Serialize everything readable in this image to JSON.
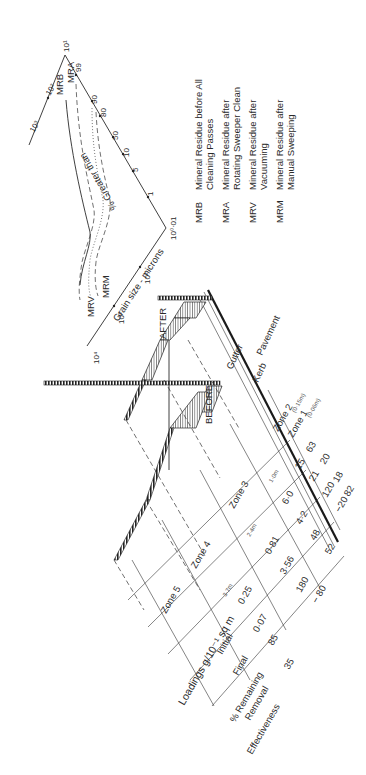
{
  "graph": {
    "x_axis_title": "Grain size - microns",
    "x_ticks": [
      "10⁴",
      "10³",
      "10²",
      "10¹",
      "10⁰·01"
    ],
    "y_axis_title": "% Greater than",
    "y_ticks": [
      "0·01",
      "1",
      "5",
      "10",
      "50",
      "80",
      "90",
      "99"
    ],
    "top_axis_ticks": [
      "10³",
      "10²",
      "10¹"
    ],
    "curve_labels": {
      "mrb": "MRB",
      "mra": "MRA",
      "mrv": "MRV",
      "mrm": "MRM"
    }
  },
  "legend": [
    {
      "code": "MRB",
      "line1": "Mineral  Residue  before  All",
      "line2": "Cleaning  Passes"
    },
    {
      "code": "MRA",
      "line1": "Mineral  Residue  after",
      "line2": "Rotating  Sweeper  Clean"
    },
    {
      "code": "MRV",
      "line1": "Mineral  Residue  after",
      "line2": "Vacuuming"
    },
    {
      "code": "MRM",
      "line1": "Mineral  Residue  after",
      "line2": "Manual  Sweeping"
    }
  ],
  "cross_section": {
    "before_label": "BEFORE",
    "after_label": "AFTER",
    "gutter_label": "Gutter",
    "kerb_label": "Kerb",
    "pavement_label": "Pavement"
  },
  "table": {
    "row_labels": {
      "loadings": "Loadings  g/10⁻¹ sq m",
      "initial": "Initial",
      "final": "Final",
      "remaining": "% Remaining",
      "removal": "Removal",
      "effectiveness": "Effectiveness"
    },
    "zones": [
      {
        "name": "Zone 5",
        "distance": "3·7m",
        "initial": "0·25",
        "final": "0·07",
        "remaining": "85",
        "removal": "35"
      },
      {
        "name": "Zone 4",
        "distance": "2·4m",
        "initial": "0·81",
        "final": "3·56",
        "remaining": "180",
        "removal": "− 80"
      },
      {
        "name": "Zone 3",
        "distance": "1·0m",
        "initial": "6·0",
        "final": "4·2",
        "remaining": "48",
        "removal": "52"
      },
      {
        "name": "Zone 2",
        "distance": "(0·15m)",
        "initial": "15",
        "final": "21",
        "remaining": "120",
        "removal": "−20"
      },
      {
        "name": "Zone 1",
        "distance": "(0·06m)",
        "initial": "63",
        "final": "20",
        "remaining": "18",
        "removal": "82"
      }
    ]
  }
}
